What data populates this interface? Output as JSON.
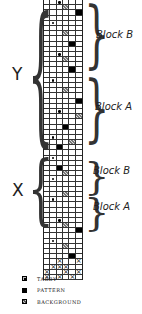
{
  "diagram": {
    "type": "weaving-draft",
    "columns": 6,
    "groups": [
      {
        "name": "Y",
        "label": "Y",
        "blocks": [
          {
            "label": "Block B"
          },
          {
            "label": "Block A"
          }
        ]
      },
      {
        "name": "X",
        "label": "X",
        "blocks": [
          {
            "label": "Block B"
          },
          {
            "label": "Block A"
          }
        ]
      }
    ],
    "cell_codes": {
      "T": "tabby",
      "P": "pattern",
      "B": "background",
      "X": "threading-x",
      ".": "empty"
    },
    "rows": [
      "..T...",
      "...B..",
      ".....P",
      "......",
      ".T....",
      "......",
      "...B..",
      "......",
      "....P.",
      "......",
      "..T...",
      "...B..",
      "......",
      "....P.",
      "......",
      ".T....",
      "......",
      "...B..",
      "......",
      ".....P",
      "......",
      "..T...",
      ".....B",
      "......",
      "...P..",
      "......",
      ".T....",
      "....B.",
      "..P...",
      "......",
      ".T....",
      "......",
      "..P...",
      "...B..",
      ".T....",
      "......",
      "......",
      "...B..",
      ".T....",
      "......",
      "......",
      "......",
      "..T...",
      "...B..",
      ".....P",
      "......",
      ".T....",
      "...B..",
      "......",
      "....P."
    ],
    "threading_rows": [
      "..X..X",
      ".XXX..",
      "X..X.X",
      "X.X.X."
    ]
  },
  "labels": {
    "y": "Y",
    "x": "X",
    "y_block_b": "Block B",
    "y_block_a": "Block A",
    "x_block_b": "Block B",
    "x_block_a": "Block A"
  },
  "legend": {
    "items": [
      {
        "key": "T",
        "label": "TABBY"
      },
      {
        "key": "P",
        "label": "PATTERN"
      },
      {
        "key": "B",
        "label": "BACKGROUND"
      }
    ]
  }
}
